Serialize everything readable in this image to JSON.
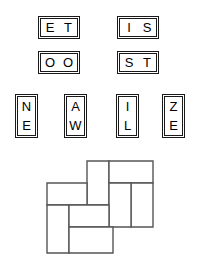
{
  "figure": {
    "type": "domino-letter-dissection-puzzle",
    "background_color": "#ffffff",
    "ink_color": "#000000",
    "diagram_stroke_color": "#555555"
  },
  "tiles": {
    "horizontal": [
      {
        "id": "tile-et",
        "letters": [
          "E",
          "T"
        ],
        "text": "ET",
        "x": 38,
        "y": 16,
        "width": 42,
        "height": 23
      },
      {
        "id": "tile-is",
        "letters": [
          "I",
          "S"
        ],
        "text": "IS",
        "x": 117,
        "y": 16,
        "width": 42,
        "height": 23
      },
      {
        "id": "tile-oo",
        "letters": [
          "O",
          "O"
        ],
        "text": "OO",
        "x": 38,
        "y": 51,
        "width": 42,
        "height": 23
      },
      {
        "id": "tile-st",
        "letters": [
          "S",
          "T"
        ],
        "text": "ST",
        "x": 117,
        "y": 51,
        "width": 42,
        "height": 23
      }
    ],
    "vertical": [
      {
        "id": "tile-ne",
        "letters": [
          "N",
          "E"
        ],
        "text": "NE",
        "x": 15,
        "y": 94,
        "width": 23,
        "height": 44
      },
      {
        "id": "tile-aw",
        "letters": [
          "A",
          "W"
        ],
        "text": "AW",
        "x": 64,
        "y": 94,
        "width": 23,
        "height": 44
      },
      {
        "id": "tile-il",
        "letters": [
          "I",
          "L"
        ],
        "text": "IL",
        "x": 116,
        "y": 94,
        "width": 23,
        "height": 44
      },
      {
        "id": "tile-ze",
        "letters": [
          "Z",
          "E"
        ],
        "text": "ZE",
        "x": 162,
        "y": 94,
        "width": 23,
        "height": 44
      }
    ]
  },
  "diagram": {
    "name": "rectangle-dissection",
    "viewbox": {
      "width": 118,
      "height": 94
    },
    "pieces": [
      {
        "id": "piece-top-middle-vertical",
        "label": "A",
        "x": 41,
        "y": 1,
        "width": 22,
        "height": 44
      },
      {
        "id": "piece-top-right-horizontal",
        "label": "B",
        "x": 63,
        "y": 1,
        "width": 44,
        "height": 22
      },
      {
        "id": "piece-right-upper-vertical",
        "label": "C",
        "x": 85,
        "y": 23,
        "width": 22,
        "height": 44
      },
      {
        "id": "piece-right-inner-vertical",
        "label": "D",
        "x": 63,
        "y": 23,
        "width": 22,
        "height": 44
      },
      {
        "id": "piece-left-upper-horizontal",
        "label": "E",
        "x": 1,
        "y": 23,
        "width": 40,
        "height": 22
      },
      {
        "id": "piece-left-lower-vertical",
        "label": "F",
        "x": 1,
        "y": 45,
        "width": 22,
        "height": 48
      },
      {
        "id": "piece-middle-horizontal",
        "label": "G",
        "x": 23,
        "y": 45,
        "width": 40,
        "height": 22
      },
      {
        "id": "piece-bottom-horizontal",
        "label": "H",
        "x": 23,
        "y": 67,
        "width": 44,
        "height": 26
      }
    ]
  }
}
